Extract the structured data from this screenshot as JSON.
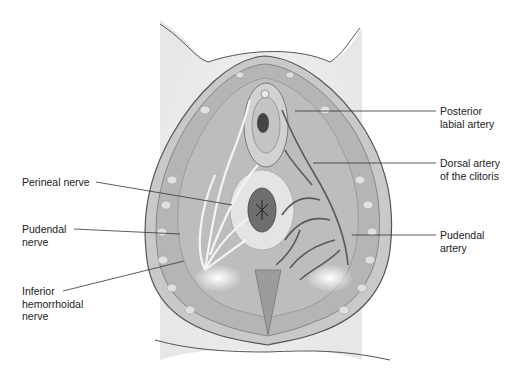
{
  "figure": {
    "type": "anatomical-illustration",
    "colors": {
      "background": "#ffffff",
      "skin": "#e6e6e6",
      "outline": "#555555",
      "muscle": "#b9b9b9",
      "fat": "#d8d8d8",
      "artery": "#5a5a5a",
      "nerve": "#f4f4f4",
      "label_text": "#222222",
      "leader_line": "#333333"
    }
  },
  "labels_left": [
    {
      "lines": [
        "Perineal nerve"
      ]
    },
    {
      "lines": [
        "Pudendal",
        "nerve"
      ]
    },
    {
      "lines": [
        "Inferior",
        "hemorrhoidal",
        "nerve"
      ]
    }
  ],
  "labels_right": [
    {
      "lines": [
        "Posterior",
        "labial artery"
      ]
    },
    {
      "lines": [
        "Dorsal artery",
        "of the clitoris"
      ]
    },
    {
      "lines": [
        "Pudendal",
        "artery"
      ]
    }
  ]
}
